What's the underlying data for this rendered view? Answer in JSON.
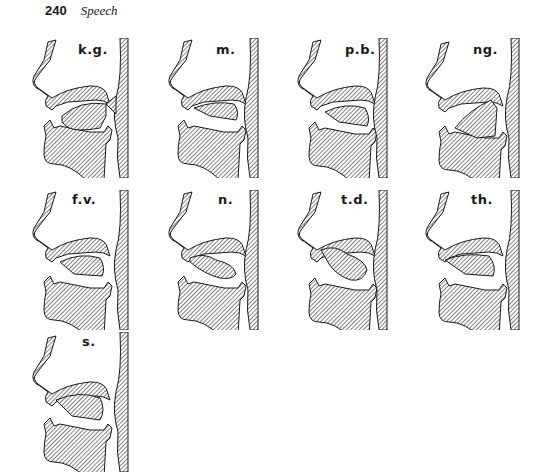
{
  "header": {
    "page_number": "240",
    "running_title": "Speech"
  },
  "figures": [
    {
      "label": "k.g.",
      "x": 20,
      "y": 38
    },
    {
      "label": "m.",
      "x": 160,
      "y": 38
    },
    {
      "label": "p.b.",
      "x": 285,
      "y": 38
    },
    {
      "label": "ng.",
      "x": 415,
      "y": 38
    },
    {
      "label": "f.v.",
      "x": 20,
      "y": 190
    },
    {
      "label": "n.",
      "x": 160,
      "y": 190
    },
    {
      "label": "t.d.",
      "x": 285,
      "y": 190
    },
    {
      "label": "th.",
      "x": 415,
      "y": 190
    },
    {
      "label": "s.",
      "x": 20,
      "y": 332
    }
  ],
  "colors": {
    "ink": "#1a1a1a",
    "paper": "#ffffff"
  }
}
